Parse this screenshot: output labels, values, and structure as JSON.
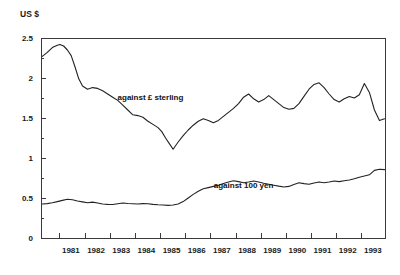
{
  "chart_data": {
    "type": "line",
    "title": "",
    "ylabel": "US $",
    "xlabel": "",
    "ylim": [
      0,
      2.5
    ],
    "xlim": [
      1980.25,
      1993.92
    ],
    "grid": false,
    "legend_position": "inline-annotation",
    "y_ticks": [
      "0",
      "0.5",
      "1",
      "1.5",
      "2",
      "2.5"
    ],
    "y_tick_values": [
      0,
      0.5,
      1,
      1.5,
      2,
      2.5
    ],
    "y_minor_tick_values": [
      0.25,
      0.75,
      1.25,
      1.75,
      2.25
    ],
    "x_ticks": [
      "1981",
      "1982",
      "1983",
      "1984",
      "1985",
      "1986",
      "1987",
      "1988",
      "1989",
      "1990",
      "1991",
      "1992",
      "1993"
    ],
    "x_tick_values": [
      1981,
      1982,
      1983,
      1984,
      1985,
      1986,
      1987,
      1988,
      1989,
      1990,
      1991,
      1992,
      1993
    ],
    "annotations": [
      {
        "text": "against £ sterling",
        "x": 1984.6,
        "y": 1.72
      },
      {
        "text": "against 100 yen",
        "x": 1988.3,
        "y": 0.62
      }
    ],
    "series": [
      {
        "name": "against £ sterling",
        "x": [
          1980.3,
          1980.5,
          1980.7,
          1980.9,
          1981.0,
          1981.15,
          1981.3,
          1981.45,
          1981.6,
          1981.75,
          1981.9,
          1982.1,
          1982.3,
          1982.5,
          1982.7,
          1982.9,
          1983.1,
          1983.3,
          1983.5,
          1983.7,
          1983.9,
          1984.1,
          1984.3,
          1984.5,
          1984.7,
          1984.9,
          1985.05,
          1985.2,
          1985.35,
          1985.5,
          1985.7,
          1985.9,
          1986.1,
          1986.3,
          1986.5,
          1986.7,
          1986.9,
          1987.1,
          1987.3,
          1987.5,
          1987.7,
          1987.9,
          1988.1,
          1988.3,
          1988.5,
          1988.7,
          1988.9,
          1989.1,
          1989.3,
          1989.5,
          1989.7,
          1989.9,
          1990.1,
          1990.3,
          1990.5,
          1990.7,
          1990.9,
          1991.1,
          1991.3,
          1991.5,
          1991.7,
          1991.9,
          1992.1,
          1992.3,
          1992.5,
          1992.7,
          1992.9,
          1993.1,
          1993.3,
          1993.5,
          1993.7,
          1993.9
        ],
        "y": [
          2.27,
          2.32,
          2.38,
          2.41,
          2.42,
          2.4,
          2.35,
          2.28,
          2.14,
          1.99,
          1.9,
          1.86,
          1.88,
          1.87,
          1.84,
          1.8,
          1.76,
          1.72,
          1.66,
          1.6,
          1.54,
          1.53,
          1.51,
          1.46,
          1.42,
          1.38,
          1.33,
          1.25,
          1.18,
          1.11,
          1.2,
          1.28,
          1.35,
          1.41,
          1.46,
          1.49,
          1.47,
          1.44,
          1.47,
          1.52,
          1.57,
          1.62,
          1.68,
          1.76,
          1.8,
          1.74,
          1.7,
          1.73,
          1.78,
          1.73,
          1.68,
          1.63,
          1.61,
          1.62,
          1.68,
          1.77,
          1.86,
          1.92,
          1.94,
          1.88,
          1.8,
          1.73,
          1.7,
          1.74,
          1.77,
          1.75,
          1.79,
          1.93,
          1.82,
          1.6,
          1.47,
          1.49
        ]
      },
      {
        "name": "against 100 yen",
        "x": [
          1980.3,
          1980.5,
          1980.7,
          1980.9,
          1981.1,
          1981.3,
          1981.5,
          1981.7,
          1981.9,
          1982.1,
          1982.3,
          1982.5,
          1982.7,
          1982.9,
          1983.1,
          1983.3,
          1983.5,
          1983.7,
          1983.9,
          1984.1,
          1984.3,
          1984.5,
          1984.7,
          1984.9,
          1985.1,
          1985.3,
          1985.5,
          1985.7,
          1985.9,
          1986.1,
          1986.3,
          1986.5,
          1986.7,
          1986.9,
          1987.1,
          1987.3,
          1987.5,
          1987.7,
          1987.9,
          1988.1,
          1988.3,
          1988.5,
          1988.7,
          1988.9,
          1989.1,
          1989.3,
          1989.5,
          1989.7,
          1989.9,
          1990.1,
          1990.3,
          1990.5,
          1990.7,
          1990.9,
          1991.1,
          1991.3,
          1991.5,
          1991.7,
          1991.9,
          1992.1,
          1992.3,
          1992.5,
          1992.7,
          1992.9,
          1993.1,
          1993.3,
          1993.5,
          1993.7,
          1993.9
        ],
        "y": [
          0.425,
          0.43,
          0.44,
          0.455,
          0.47,
          0.485,
          0.478,
          0.462,
          0.452,
          0.44,
          0.448,
          0.438,
          0.425,
          0.42,
          0.418,
          0.428,
          0.438,
          0.432,
          0.428,
          0.425,
          0.43,
          0.428,
          0.42,
          0.415,
          0.412,
          0.408,
          0.412,
          0.425,
          0.455,
          0.5,
          0.545,
          0.585,
          0.615,
          0.63,
          0.645,
          0.66,
          0.68,
          0.7,
          0.715,
          0.705,
          0.69,
          0.7,
          0.712,
          0.7,
          0.685,
          0.672,
          0.66,
          0.648,
          0.638,
          0.645,
          0.668,
          0.69,
          0.68,
          0.672,
          0.688,
          0.7,
          0.69,
          0.7,
          0.712,
          0.705,
          0.715,
          0.725,
          0.74,
          0.76,
          0.775,
          0.79,
          0.845,
          0.86,
          0.855
        ]
      }
    ]
  }
}
